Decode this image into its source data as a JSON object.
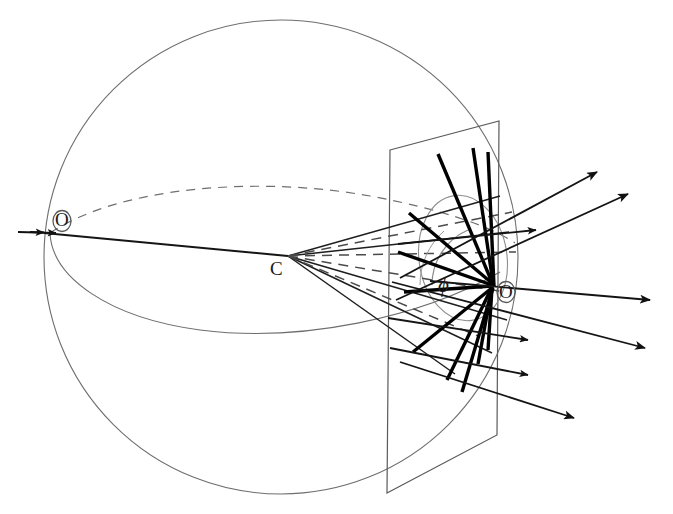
{
  "figure": {
    "type": "geometric-optics-diagram",
    "width": 673,
    "height": 514,
    "background_color": "#ffffff",
    "line_color_thin": "#555555",
    "line_color_medium": "#2b2b2b",
    "line_color_heavy": "#000000",
    "dash_color": "#666666"
  },
  "labels": {
    "origin_left": "O",
    "centre": "C",
    "origin_right": "O",
    "angle_phi": "ϕ"
  },
  "label_positions": {
    "origin_left": {
      "x": 55,
      "y": 210
    },
    "centre": {
      "x": 272,
      "y": 258
    },
    "origin_right": {
      "x": 498,
      "y": 282
    },
    "angle_phi": {
      "x": 440,
      "y": 274
    }
  },
  "geometry": {
    "sphere": {
      "label": "outer sphere",
      "cx": 281,
      "cy": 257,
      "r": 237,
      "stroke": "#6a6a6a",
      "stroke_width": 1.1
    },
    "equator_far": {
      "label": "dashed equator (far half)",
      "style": "dashed",
      "dash": "9 7",
      "stroke": "#6f6f6f"
    },
    "equator_near": {
      "label": "solid equator (near half)",
      "style": "solid",
      "stroke": "#6a6a6a"
    },
    "plane": {
      "label": "observation plane (quadrilateral)",
      "corners": [
        {
          "x": 390,
          "y": 150
        },
        {
          "x": 499,
          "y": 121
        },
        {
          "x": 497,
          "y": 435
        },
        {
          "x": 387,
          "y": 493
        }
      ],
      "stroke": "#5a5a5a",
      "stroke_width": 1.2
    },
    "scatter_circle": {
      "label": "circular section on plane",
      "cx": 463,
      "cy": 258,
      "rx": 44,
      "ry": 63,
      "rotate": -8,
      "stroke": "#8a8a8a"
    },
    "incident_axis": {
      "label": "incident beam axis",
      "from": {
        "x": 20,
        "y": 232
      },
      "to": {
        "x": 288,
        "y": 256
      }
    },
    "scatter_origin": {
      "x": 492,
      "y": 285
    },
    "angle_arc": {
      "label": "phi angle arc",
      "cx": 492,
      "cy": 285,
      "r": 60,
      "from_deg": 180,
      "to_deg": 248
    }
  },
  "incident_arrows": [
    {
      "from": {
        "x": 18,
        "y": 232
      },
      "to": {
        "x": 40,
        "y": 233
      }
    },
    {
      "from": {
        "x": 28,
        "y": 232
      },
      "to": {
        "x": 52,
        "y": 233
      }
    }
  ],
  "cone_rays": {
    "description": "Rays from C to the rim of the circular section on the plane",
    "solid": [
      {
        "from": {
          "x": 288,
          "y": 256
        },
        "to": {
          "x": 500,
          "y": 196
        }
      },
      {
        "from": {
          "x": 288,
          "y": 256
        },
        "to": {
          "x": 508,
          "y": 232
        }
      },
      {
        "from": {
          "x": 288,
          "y": 256
        },
        "to": {
          "x": 507,
          "y": 320
        }
      },
      {
        "from": {
          "x": 288,
          "y": 256
        },
        "to": {
          "x": 492,
          "y": 353
        }
      },
      {
        "from": {
          "x": 288,
          "y": 256
        },
        "to": {
          "x": 455,
          "y": 374
        }
      }
    ],
    "dashed": [
      {
        "from": {
          "x": 288,
          "y": 256
        },
        "to": {
          "x": 512,
          "y": 212
        }
      },
      {
        "from": {
          "x": 288,
          "y": 256
        },
        "to": {
          "x": 515,
          "y": 252
        }
      },
      {
        "from": {
          "x": 288,
          "y": 256
        },
        "to": {
          "x": 505,
          "y": 292
        }
      },
      {
        "from": {
          "x": 288,
          "y": 256
        },
        "to": {
          "x": 476,
          "y": 336
        }
      }
    ]
  },
  "scattered_arrows": [
    {
      "label": "ray-up-1",
      "from": {
        "x": 470,
        "y": 258
      },
      "to": {
        "x": 597,
        "y": 172
      }
    },
    {
      "label": "ray-up-2",
      "from": {
        "x": 476,
        "y": 272
      },
      "to": {
        "x": 628,
        "y": 194
      }
    },
    {
      "label": "ray-up-3",
      "from": {
        "x": 480,
        "y": 240
      },
      "to": {
        "x": 536,
        "y": 230
      }
    },
    {
      "label": "ray-mid-1",
      "from": {
        "x": 491,
        "y": 285
      },
      "to": {
        "x": 650,
        "y": 300
      }
    },
    {
      "label": "ray-mid-2",
      "from": {
        "x": 470,
        "y": 302
      },
      "to": {
        "x": 645,
        "y": 348
      }
    },
    {
      "label": "ray-mid-3",
      "from": {
        "x": 430,
        "y": 325
      },
      "to": {
        "x": 528,
        "y": 340
      }
    },
    {
      "label": "ray-low-1",
      "from": {
        "x": 404,
        "y": 332
      },
      "to": {
        "x": 528,
        "y": 375
      }
    },
    {
      "label": "ray-low-2",
      "from": {
        "x": 408,
        "y": 355
      },
      "to": {
        "x": 574,
        "y": 418
      }
    }
  ],
  "heavy_segments": {
    "description": "Short bold chords crossing near the scattering point O",
    "items": [
      {
        "from": {
          "x": 438,
          "y": 154
        },
        "to": {
          "x": 494,
          "y": 287
        }
      },
      {
        "from": {
          "x": 473,
          "y": 148
        },
        "to": {
          "x": 493,
          "y": 283
        }
      },
      {
        "from": {
          "x": 488,
          "y": 152
        },
        "to": {
          "x": 494,
          "y": 286
        }
      },
      {
        "from": {
          "x": 409,
          "y": 213
        },
        "to": {
          "x": 493,
          "y": 284
        }
      },
      {
        "from": {
          "x": 398,
          "y": 252
        },
        "to": {
          "x": 492,
          "y": 285
        }
      },
      {
        "from": {
          "x": 404,
          "y": 292
        },
        "to": {
          "x": 492,
          "y": 286
        }
      },
      {
        "from": {
          "x": 413,
          "y": 352
        },
        "to": {
          "x": 493,
          "y": 287
        }
      },
      {
        "from": {
          "x": 447,
          "y": 380
        },
        "to": {
          "x": 492,
          "y": 287
        }
      },
      {
        "from": {
          "x": 462,
          "y": 392
        },
        "to": {
          "x": 493,
          "y": 288
        }
      },
      {
        "from": {
          "x": 478,
          "y": 364
        },
        "to": {
          "x": 492,
          "y": 287
        }
      },
      {
        "from": {
          "x": 488,
          "y": 350
        },
        "to": {
          "x": 492,
          "y": 288
        }
      }
    ]
  }
}
